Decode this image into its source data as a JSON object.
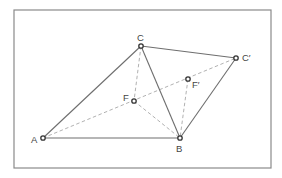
{
  "diagram": {
    "frame": {
      "x": 14,
      "y": 10,
      "width": 257,
      "height": 158
    },
    "colors": {
      "frame": "#8a8a8a",
      "solid_line": "#6e6e6e",
      "dashed_line": "#a8a8a8",
      "point_stroke": "#333333",
      "label": "#444444"
    },
    "points": [
      {
        "id": "A",
        "label": "A",
        "x": 43,
        "y": 138,
        "label_x": 31,
        "label_y": 143
      },
      {
        "id": "B",
        "label": "B",
        "x": 180,
        "y": 138,
        "label_x": 176,
        "label_y": 152
      },
      {
        "id": "C",
        "label": "C",
        "x": 141,
        "y": 46,
        "label_x": 137,
        "label_y": 41
      },
      {
        "id": "C'",
        "label": "C′",
        "x": 236,
        "y": 58,
        "label_x": 242,
        "label_y": 61
      },
      {
        "id": "F",
        "label": "F",
        "x": 134,
        "y": 101,
        "label_x": 123,
        "label_y": 101
      },
      {
        "id": "F'",
        "label": "F′",
        "x": 188,
        "y": 79,
        "label_x": 192,
        "label_y": 88
      }
    ],
    "solid_segments": [
      {
        "from": "A",
        "to": "C"
      },
      {
        "from": "A",
        "to": "B"
      },
      {
        "from": "C",
        "to": "B"
      },
      {
        "from": "C",
        "to": "C'"
      },
      {
        "from": "B",
        "to": "C'"
      }
    ],
    "dashed_segments": [
      {
        "from": "A",
        "to": "C'"
      },
      {
        "from": "C",
        "to": "F"
      },
      {
        "from": "F",
        "to": "B"
      },
      {
        "from": "F'",
        "to": "B"
      }
    ]
  }
}
